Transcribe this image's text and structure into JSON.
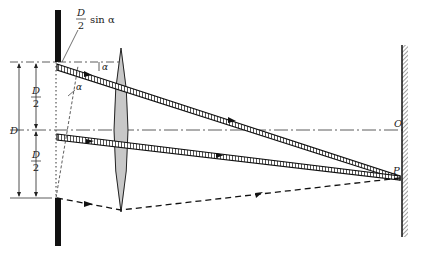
{
  "figure": {
    "colors": {
      "ink": "#111111",
      "lens_fill": "#c8c8c8",
      "beam_fill": "#ffffff",
      "screen_hatch": "#444444"
    }
  },
  "labels": {
    "path_diff_numerator": "D",
    "path_diff_denominator": "2",
    "path_diff_suffix": "sin α",
    "alpha_top": "α",
    "alpha_slit": "α",
    "D_total": "D",
    "half_top_numerator": "D",
    "half_top_denominator": "2",
    "half_bottom_numerator": "D",
    "half_bottom_denominator": "2",
    "point_O": "O",
    "point_P": "P"
  },
  "elements": {
    "slit_plate": "opaque plate with slit",
    "lens": "converging lens",
    "screen": "observation screen",
    "optical_axis": "dash-dot axis"
  }
}
